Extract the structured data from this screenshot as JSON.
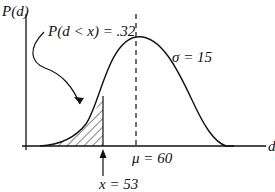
{
  "diagram": {
    "y_axis_label": "P(d)",
    "x_axis_label": "d",
    "probability_label": "P(d < x) = .32",
    "sigma_label": "σ = 15",
    "mu_label": "μ = 60",
    "x_label": "x = 53",
    "distribution": "normal",
    "mean": 60,
    "std_dev": 15,
    "x_value": 53,
    "shaded_probability": 0.32,
    "colors": {
      "line": "#111111",
      "background": "#ffffff"
    }
  }
}
